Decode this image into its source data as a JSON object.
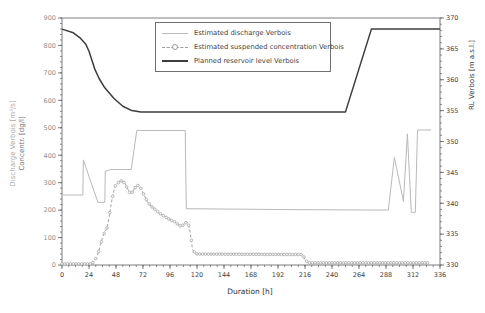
{
  "chart_data": {
    "type": "line",
    "title": "",
    "xlabel": "Duration [h]",
    "left_axis_title_line1": "Discharge Verbois [m³/s]",
    "left_axis_title_line2": "Concentr. [dg/l]",
    "right_axis_title": "RL Verbois [m a.s.l.]",
    "xlim": [
      0,
      336
    ],
    "left_ylim": [
      0,
      900
    ],
    "right_ylim": [
      330,
      370
    ],
    "xticks": [
      0,
      24,
      48,
      72,
      96,
      120,
      144,
      168,
      192,
      216,
      240,
      264,
      288,
      312,
      336
    ],
    "left_yticks": [
      0,
      100,
      200,
      300,
      400,
      500,
      600,
      700,
      800,
      900
    ],
    "right_yticks": [
      330,
      335,
      340,
      345,
      350,
      355,
      360,
      365,
      370
    ],
    "x_minor_step": 6,
    "left_y_minor_step": 20,
    "right_y_minor_step": 1,
    "grid": false,
    "legend_position": "top-center",
    "series": [
      {
        "name": "Estimated discharge Verbois",
        "axis": "left",
        "line_style": "solid",
        "color": "#b9b9b9",
        "stroke_width": 1,
        "points": [
          [
            0,
            255
          ],
          [
            18.5,
            255
          ],
          [
            19,
            383
          ],
          [
            25,
            310
          ],
          [
            32,
            228
          ],
          [
            38,
            228
          ],
          [
            38.5,
            341
          ],
          [
            43,
            348
          ],
          [
            61.5,
            348
          ],
          [
            66.5,
            490
          ],
          [
            109.5,
            490
          ],
          [
            110.5,
            205
          ],
          [
            200,
            202
          ],
          [
            290,
            200
          ],
          [
            295.5,
            392
          ],
          [
            303.5,
            232
          ],
          [
            307,
            478
          ],
          [
            310.5,
            192
          ],
          [
            314,
            192
          ],
          [
            316,
            492
          ],
          [
            328,
            492
          ]
        ]
      },
      {
        "name": "Estimated suspended concentration Verbois",
        "axis": "left",
        "line_style": "dashed",
        "marker": "circle",
        "marker_step_h": 2.5,
        "color": "#9a9a9a",
        "stroke_width": 0.9,
        "points": [
          [
            0,
            4
          ],
          [
            25,
            4
          ],
          [
            28,
            10
          ],
          [
            31,
            30
          ],
          [
            33,
            55
          ],
          [
            36,
            100
          ],
          [
            38,
            120
          ],
          [
            40,
            135
          ],
          [
            42,
            178
          ],
          [
            44,
            230
          ],
          [
            46,
            270
          ],
          [
            48,
            295
          ],
          [
            50,
            300
          ],
          [
            52,
            307
          ],
          [
            54,
            303
          ],
          [
            56,
            298
          ],
          [
            58,
            280
          ],
          [
            60,
            265
          ],
          [
            62,
            262
          ],
          [
            64,
            275
          ],
          [
            66,
            288
          ],
          [
            68,
            290
          ],
          [
            70,
            280
          ],
          [
            73,
            255
          ],
          [
            76,
            230
          ],
          [
            79,
            215
          ],
          [
            82,
            205
          ],
          [
            85,
            195
          ],
          [
            88,
            185
          ],
          [
            91,
            177
          ],
          [
            94,
            170
          ],
          [
            97,
            163
          ],
          [
            100,
            158
          ],
          [
            103,
            148
          ],
          [
            106,
            140
          ],
          [
            109,
            150
          ],
          [
            111,
            158
          ],
          [
            113,
            140
          ],
          [
            115,
            90
          ],
          [
            116,
            56
          ],
          [
            118,
            45
          ],
          [
            120,
            40
          ],
          [
            214,
            38
          ],
          [
            216,
            20
          ],
          [
            219,
            8
          ],
          [
            326,
            8
          ]
        ]
      },
      {
        "name": "Planned reservoir level Verbois",
        "axis": "right",
        "line_style": "solid",
        "color": "#3c3c3c",
        "stroke_width": 1.5,
        "points": [
          [
            0,
            368.2
          ],
          [
            10,
            367.6
          ],
          [
            16,
            366.8
          ],
          [
            21,
            365.8
          ],
          [
            24,
            364.6
          ],
          [
            29,
            361.8
          ],
          [
            33,
            360.2
          ],
          [
            38,
            358.7
          ],
          [
            46,
            357
          ],
          [
            54,
            355.7
          ],
          [
            62,
            355
          ],
          [
            70,
            354.8
          ],
          [
            252,
            354.8
          ],
          [
            275,
            368.2
          ],
          [
            336,
            368.2
          ]
        ]
      }
    ]
  },
  "colors": {
    "discharge": "#b9b9b9",
    "concentration": "#9a9a9a",
    "reservoir": "#3c3c3c",
    "plot_border": "#5e5e5e",
    "left_tick_text": "#8f8f8f",
    "tick_text": "#3f3f3f"
  }
}
